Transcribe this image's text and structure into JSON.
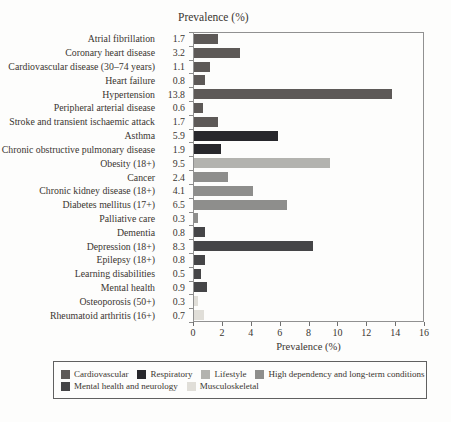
{
  "chart_data": {
    "type": "bar",
    "orientation": "horizontal",
    "title": "Prevalence (%)",
    "xlabel": "Prevalence (%)",
    "xlim": [
      0,
      16
    ],
    "xticks": [
      0,
      2,
      4,
      6,
      8,
      10,
      12,
      14,
      16
    ],
    "grid": false,
    "legend_position": "bottom-box",
    "bars": [
      {
        "label": "Atrial fibrillation",
        "value": 1.7,
        "group": "cardiovascular"
      },
      {
        "label": "Coronary heart disease",
        "value": 3.2,
        "group": "cardiovascular"
      },
      {
        "label": "Cardiovascular disease (30–74 years)",
        "value": 1.1,
        "group": "cardiovascular"
      },
      {
        "label": "Heart failure",
        "value": 0.8,
        "group": "cardiovascular"
      },
      {
        "label": "Hypertension",
        "value": 13.8,
        "group": "cardiovascular"
      },
      {
        "label": "Peripheral arterial disease",
        "value": 0.6,
        "group": "cardiovascular"
      },
      {
        "label": "Stroke and transient ischaemic attack",
        "value": 1.7,
        "group": "cardiovascular"
      },
      {
        "label": "Asthma",
        "value": 5.9,
        "group": "respiratory"
      },
      {
        "label": "Chronic obstructive pulmonary disease",
        "value": 1.9,
        "group": "respiratory"
      },
      {
        "label": "Obesity (18+)",
        "value": 9.5,
        "group": "lifestyle"
      },
      {
        "label": "Cancer",
        "value": 2.4,
        "group": "high_dependency"
      },
      {
        "label": "Chronic kidney disease (18+)",
        "value": 4.1,
        "group": "high_dependency"
      },
      {
        "label": "Diabetes mellitus (17+)",
        "value": 6.5,
        "group": "high_dependency"
      },
      {
        "label": "Palliative care",
        "value": 0.3,
        "group": "high_dependency"
      },
      {
        "label": "Dementia",
        "value": 0.8,
        "group": "mental_health"
      },
      {
        "label": "Depression (18+)",
        "value": 8.3,
        "group": "mental_health"
      },
      {
        "label": "Epilepsy (18+)",
        "value": 0.8,
        "group": "mental_health"
      },
      {
        "label": "Learning disabilities",
        "value": 0.5,
        "group": "mental_health"
      },
      {
        "label": "Mental health",
        "value": 0.9,
        "group": "mental_health"
      },
      {
        "label": "Osteoporosis (50+)",
        "value": 0.3,
        "group": "musculoskeletal"
      },
      {
        "label": "Rheumatoid arthritis (16+)",
        "value": 0.7,
        "group": "musculoskeletal"
      }
    ],
    "groups": {
      "cardiovascular": {
        "label": "Cardiovascular",
        "color": "#5d5957"
      },
      "respiratory": {
        "label": "Respiratory",
        "color": "#27272b"
      },
      "lifestyle": {
        "label": "Lifestyle",
        "color": "#b3b3af"
      },
      "high_dependency": {
        "label": "High dependency and long-term conditions",
        "color": "#8e8e8c"
      },
      "mental_health": {
        "label": "Mental health and neurology",
        "color": "#454547"
      },
      "musculoskeletal": {
        "label": "Musculoskeletal",
        "color": "#e0ded8"
      }
    },
    "legend_rows": [
      [
        "cardiovascular",
        "respiratory",
        "lifestyle",
        "high_dependency"
      ],
      [
        "mental_health",
        "musculoskeletal"
      ]
    ]
  }
}
